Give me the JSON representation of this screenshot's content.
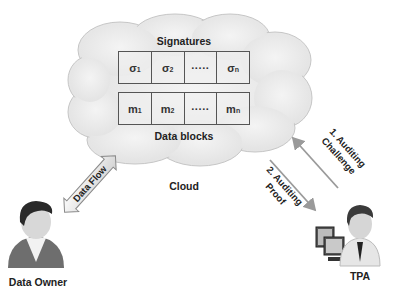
{
  "cloud": {
    "label": "Cloud",
    "signatures": {
      "title": "Signatures",
      "cells": [
        {
          "base": "σ",
          "sub": "1"
        },
        {
          "base": "σ",
          "sub": "2"
        },
        {
          "base": "·····",
          "sub": ""
        },
        {
          "base": "σ",
          "sub": "n"
        }
      ]
    },
    "data_blocks": {
      "title": "Data blocks",
      "cells": [
        {
          "base": "m",
          "sub": "1"
        },
        {
          "base": "m",
          "sub": "2"
        },
        {
          "base": "·····",
          "sub": ""
        },
        {
          "base": "m",
          "sub": "n"
        }
      ]
    }
  },
  "actors": {
    "data_owner": {
      "label": "Data Owner"
    },
    "tpa": {
      "label": "TPA"
    }
  },
  "arrows": {
    "data_flow": {
      "label": "Data Flow"
    },
    "challenge": {
      "line1": "1. Auditing",
      "line2": "Challenge"
    },
    "proof": {
      "line1": "2. Auditing",
      "line2": "Proof"
    }
  },
  "colors": {
    "cloud_fill": "#ececec",
    "cloud_stroke": "#c8c8c8",
    "arrow": "#9a9a9a",
    "table_border": "#555555"
  }
}
